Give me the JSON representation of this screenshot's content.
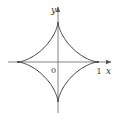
{
  "diagram": {
    "type": "astroid",
    "equation": "x^(2/3) + y^(2/3) = 1",
    "labels": {
      "y_axis": "y",
      "x_axis": "x",
      "origin": "0",
      "x_tick": "1"
    },
    "colors": {
      "curve": "#3a3a3a",
      "axis": "#555555",
      "text": "#333333",
      "background": "#ffffff"
    },
    "geometry": {
      "origin_px": [
        58,
        62
      ],
      "radius_px": 40,
      "x_axis_range_px": [
        8,
        111
      ],
      "y_axis_range_px": [
        7,
        113
      ]
    }
  }
}
